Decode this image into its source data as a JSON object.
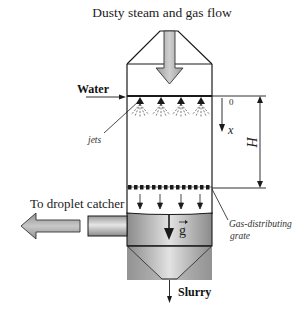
{
  "diagram": {
    "title": "Dusty steam and gas flow",
    "labels": {
      "water": "Water",
      "jets": "jets",
      "origin": "0",
      "x_axis": "x",
      "height": "H",
      "droplet_catcher": "To droplet catcher",
      "gravity": "g",
      "gravity_vector_mark": "→",
      "grate_line1": "Gas-distributing",
      "grate_line2": "grate",
      "slurry": "Slurry"
    },
    "components": [
      "inlet-hood",
      "spray-column",
      "water-jets",
      "gas-distributing-grate",
      "liquid-tank",
      "outlet-pipe",
      "conical-bottom",
      "slurry-outlet"
    ],
    "colors": {
      "line": "#1a1a1a",
      "arrow_fill": "#a8a8a8",
      "tank_light": "#d8d8d8",
      "tank_dark": "#8e8e8e",
      "background": "#ffffff"
    }
  }
}
